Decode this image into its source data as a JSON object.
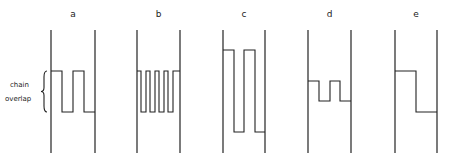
{
  "panels": [
    {
      "label": "a",
      "left_wall": 51,
      "right_wall": 95,
      "top": 71,
      "bottom": 112,
      "xs": [
        51,
        62,
        73,
        84,
        95
      ],
      "start": "top"
    },
    {
      "label": "b",
      "left_wall": 137,
      "right_wall": 180,
      "top": 71,
      "bottom": 112,
      "xs": [
        137,
        141,
        146,
        150,
        155,
        159,
        164,
        168,
        173,
        180
      ],
      "start": "top"
    },
    {
      "label": "c",
      "left_wall": 223,
      "right_wall": 265,
      "top": 50,
      "bottom": 132,
      "xs": [
        223,
        234,
        244,
        255,
        265
      ],
      "start": "top"
    },
    {
      "label": "d",
      "left_wall": 308,
      "right_wall": 351,
      "top": 81,
      "bottom": 101,
      "xs": [
        308,
        319,
        330,
        340,
        351
      ],
      "start": "top"
    },
    {
      "label": "e",
      "left_wall": 395,
      "right_wall": 437,
      "top": 71,
      "bottom": 112,
      "xs": [
        395,
        416,
        437
      ],
      "start": "top"
    }
  ],
  "wall_top": 30,
  "wall_bottom": 153,
  "label_y": 17,
  "annotation": {
    "line1": "chain",
    "line2": "overlap",
    "brace_x": 45,
    "brace_top": 71,
    "brace_bottom": 112
  }
}
